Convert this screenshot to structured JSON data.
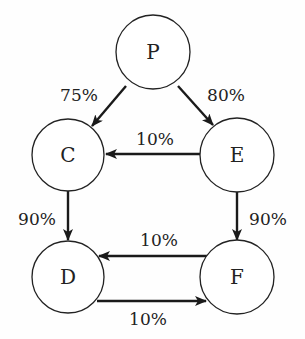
{
  "diagram": {
    "nodes": [
      {
        "id": "P",
        "label": "P"
      },
      {
        "id": "C",
        "label": "C"
      },
      {
        "id": "E",
        "label": "E"
      },
      {
        "id": "D",
        "label": "D"
      },
      {
        "id": "F",
        "label": "F"
      }
    ],
    "edges": [
      {
        "from": "P",
        "to": "C",
        "label": "75%"
      },
      {
        "from": "P",
        "to": "E",
        "label": "80%"
      },
      {
        "from": "E",
        "to": "C",
        "label": "10%"
      },
      {
        "from": "C",
        "to": "D",
        "label": "90%"
      },
      {
        "from": "E",
        "to": "F",
        "label": "90%"
      },
      {
        "from": "F",
        "to": "D",
        "label": "10%"
      },
      {
        "from": "D",
        "to": "F",
        "label": "10%"
      }
    ]
  }
}
